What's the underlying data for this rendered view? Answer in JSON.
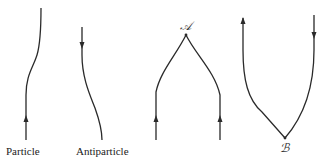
{
  "diagrams": [
    {
      "id": "particle",
      "label": "Particle",
      "arrow_direction": "up"
    },
    {
      "id": "antiparticle",
      "label": "Antiparticle",
      "arrow_direction": "down"
    },
    {
      "id": "pair-annihilation",
      "vertex_label": "𝒜",
      "arrows": [
        "up",
        "up"
      ]
    },
    {
      "id": "pair-creation",
      "vertex_label": "ℬ",
      "arrows": [
        "up",
        "down"
      ]
    }
  ],
  "colors": {
    "line": "#2a2a2a",
    "text": "#222222"
  }
}
